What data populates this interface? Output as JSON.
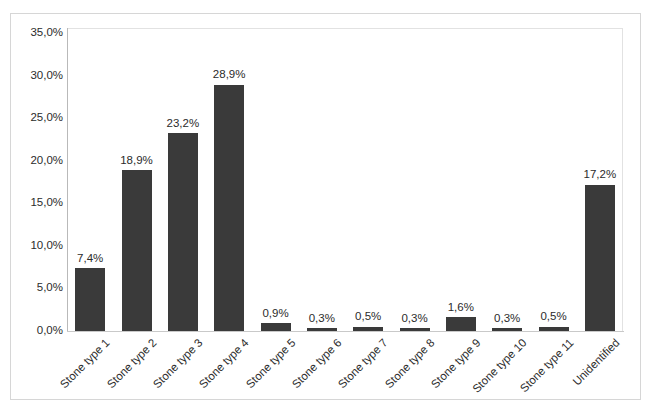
{
  "chart_data": {
    "type": "bar",
    "title": "",
    "subtitle": "",
    "xlabel": "",
    "ylabel": "",
    "grid": false,
    "legend": "none",
    "ylim": [
      0,
      35
    ],
    "ytick_labels": [
      "35,0%",
      "30,0%",
      "25,0%",
      "20,0%",
      "15,0%",
      "10,0%",
      "5,0%",
      "0,0%"
    ],
    "ytick_values": [
      35,
      30,
      25,
      20,
      15,
      10,
      5,
      0
    ],
    "decimal_separator": ",",
    "bar_color": "#3a3a3a",
    "categories": [
      "Stone type 1",
      "Stone type 2",
      "Stone type 3",
      "Stone type 4",
      "Stone type 5",
      "Stone type 6",
      "Stone type 7",
      "Stone type 8",
      "Stone type 9",
      "Stone type 10",
      "Stone type 11",
      "Unidentified"
    ],
    "values": [
      7.4,
      18.9,
      23.2,
      28.9,
      0.9,
      0.3,
      0.5,
      0.3,
      1.6,
      0.3,
      0.5,
      17.2
    ],
    "data_labels": [
      "7,4%",
      "18,9%",
      "23,2%",
      "28,9%",
      "0,9%",
      "0,3%",
      "0,5%",
      "0,3%",
      "1,6%",
      "0,3%",
      "0,5%",
      "17,2%"
    ]
  }
}
